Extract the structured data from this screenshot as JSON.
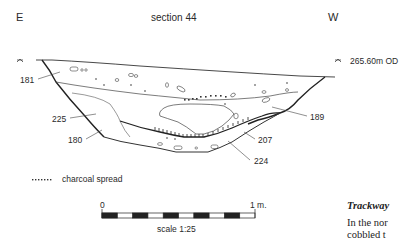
{
  "figure": {
    "title": "section 44",
    "east_label": "E",
    "west_label": "W",
    "datum": "265.60m OD",
    "contexts": [
      "181",
      "225",
      "180",
      "207",
      "224",
      "189"
    ],
    "legend": {
      "charcoal_spread": "charcoal spread"
    },
    "scale": {
      "start": "0",
      "end": "1 m.",
      "label": "scale 1:25"
    }
  },
  "text": {
    "heading": "Trackway",
    "line1": "In the nor",
    "line2": "cobbled t"
  }
}
